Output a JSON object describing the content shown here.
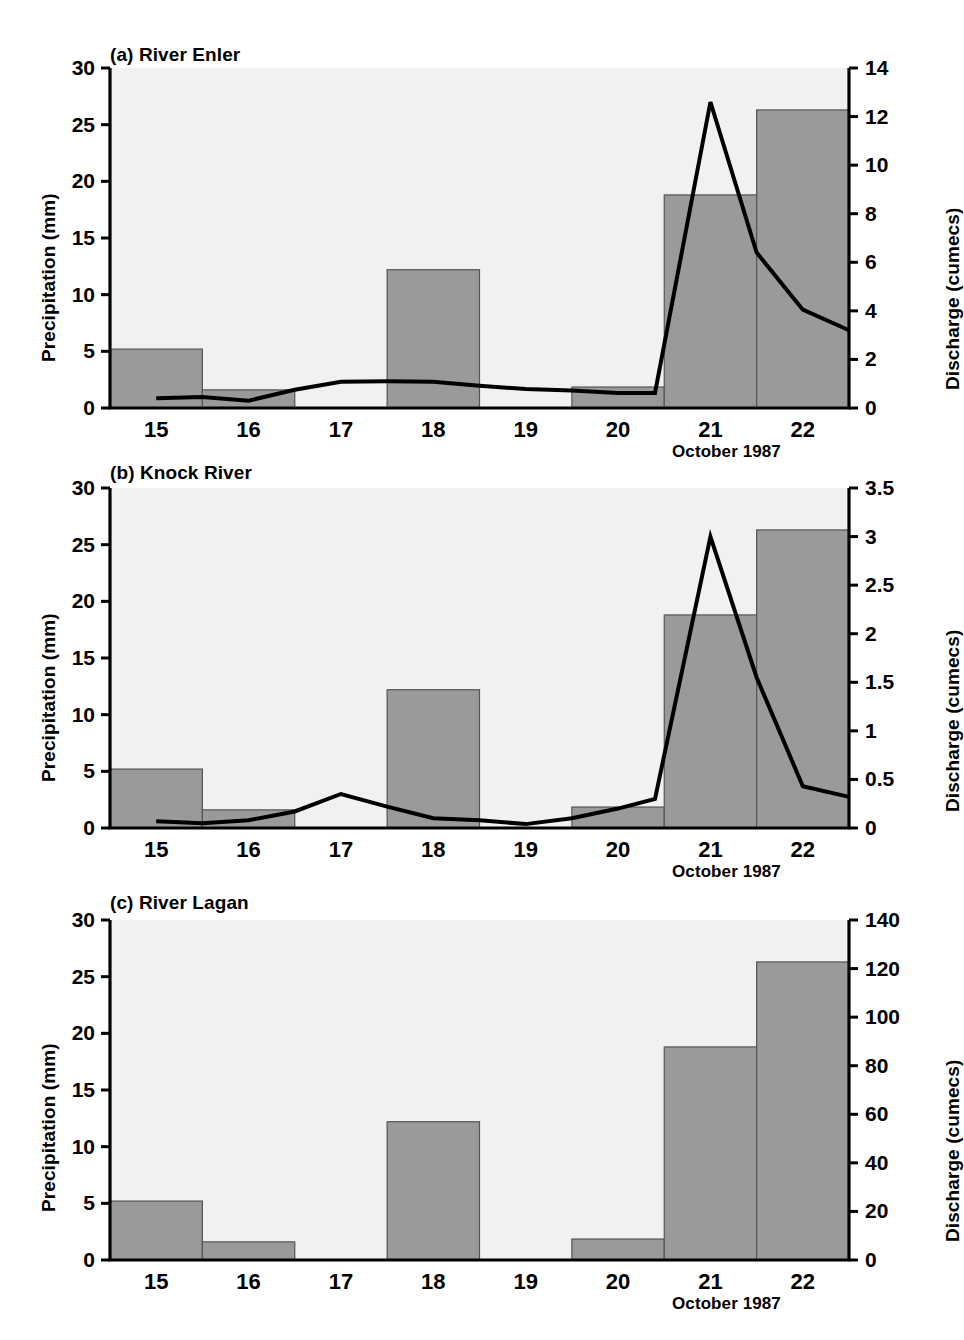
{
  "figure": {
    "background": "#ffffff",
    "bar_fill": "#9a9a9a",
    "bar_stroke": "#555555",
    "plot_bg": "#f1f1f1",
    "axis_color": "#000000",
    "line_color": "#000000"
  },
  "common": {
    "ylabel_left": "Precipitation (mm)",
    "ylabel_right": "Discharge (cumecs)",
    "xaxis_note": "October 1987",
    "x_categories": [
      "15",
      "16",
      "17",
      "18",
      "19",
      "20",
      "21",
      "22"
    ],
    "precip_ticks": [
      "0",
      "5",
      "10",
      "15",
      "20",
      "25",
      "30"
    ],
    "precipitation": [
      5.2,
      1.6,
      0.0,
      12.2,
      0.0,
      1.85,
      18.8,
      26.3
    ]
  },
  "chart_data": [
    {
      "id": "a",
      "type": "bar",
      "title": "(a) River Enler",
      "xlabel": "October 1987",
      "ylabel": "Precipitation (mm)",
      "ylabel2": "Discharge (cumecs)",
      "categories": [
        "15",
        "16",
        "17",
        "18",
        "19",
        "20",
        "21",
        "22"
      ],
      "ylim": [
        0,
        30
      ],
      "yticks": [
        0,
        5,
        10,
        15,
        20,
        25,
        30
      ],
      "ytick_labels": [
        "0",
        "5",
        "10",
        "15",
        "20",
        "25",
        "30"
      ],
      "ylim2": [
        0,
        14
      ],
      "yticks2": [
        0,
        2,
        4,
        6,
        8,
        10,
        12,
        14
      ],
      "ytick_labels2": [
        "0",
        "2",
        "4",
        "6",
        "8",
        "10",
        "12",
        "14"
      ],
      "grid": false,
      "legend": "none",
      "series": [
        {
          "name": "Precipitation",
          "type": "bar",
          "axis": "left",
          "values": [
            5.2,
            1.6,
            0.0,
            12.2,
            0.0,
            1.85,
            18.8,
            26.3
          ]
        },
        {
          "name": "Discharge",
          "type": "line",
          "axis": "right",
          "x": [
            15.0,
            15.5,
            16.0,
            16.5,
            17.0,
            17.5,
            18.0,
            18.5,
            19.0,
            19.5,
            20.0,
            20.4,
            21.0,
            21.5,
            22.0,
            22.5
          ],
          "values": [
            0.4,
            0.45,
            0.3,
            0.75,
            1.08,
            1.1,
            1.08,
            0.92,
            0.78,
            0.72,
            0.62,
            0.62,
            12.6,
            6.4,
            4.05,
            3.2
          ]
        }
      ]
    },
    {
      "id": "b",
      "type": "bar",
      "title": "(b) Knock River",
      "xlabel": "October 1987",
      "ylabel": "Precipitation (mm)",
      "ylabel2": "Discharge (cumecs)",
      "categories": [
        "15",
        "16",
        "17",
        "18",
        "19",
        "20",
        "21",
        "22"
      ],
      "ylim": [
        0,
        30
      ],
      "yticks": [
        0,
        5,
        10,
        15,
        20,
        25,
        30
      ],
      "ytick_labels": [
        "0",
        "5",
        "10",
        "15",
        "20",
        "25",
        "30"
      ],
      "ylim2": [
        0,
        3.5
      ],
      "yticks2": [
        0,
        0.5,
        1,
        1.5,
        2,
        2.5,
        3,
        3.5
      ],
      "ytick_labels2": [
        "0",
        "0.5",
        "1",
        "1.5",
        "2",
        "2.5",
        "3",
        "3.5"
      ],
      "grid": false,
      "legend": "none",
      "series": [
        {
          "name": "Precipitation",
          "type": "bar",
          "axis": "left",
          "values": [
            5.2,
            1.6,
            0.0,
            12.2,
            0.0,
            1.85,
            18.8,
            26.3
          ]
        },
        {
          "name": "Discharge",
          "type": "line",
          "axis": "right",
          "x": [
            15.0,
            15.5,
            16.0,
            16.5,
            17.0,
            17.5,
            18.0,
            18.5,
            19.0,
            19.5,
            20.0,
            20.4,
            21.0,
            21.5,
            22.0,
            22.5
          ],
          "values": [
            0.07,
            0.05,
            0.08,
            0.17,
            0.35,
            0.22,
            0.1,
            0.08,
            0.04,
            0.1,
            0.2,
            0.3,
            3.0,
            1.55,
            0.43,
            0.32
          ]
        }
      ]
    },
    {
      "id": "c",
      "type": "bar",
      "title": "(c) River Lagan",
      "xlabel": "October 1987",
      "ylabel": "Precipitation (mm)",
      "ylabel2": "Discharge (cumecs)",
      "categories": [
        "15",
        "16",
        "17",
        "18",
        "19",
        "20",
        "21",
        "22"
      ],
      "ylim": [
        0,
        30
      ],
      "yticks": [
        0,
        5,
        10,
        15,
        20,
        25,
        30
      ],
      "ytick_labels": [
        "0",
        "5",
        "10",
        "15",
        "20",
        "25",
        "30"
      ],
      "ylim2": [
        0,
        140
      ],
      "yticks2": [
        0,
        20,
        40,
        60,
        80,
        100,
        120,
        140
      ],
      "ytick_labels2": [
        "0",
        "20",
        "40",
        "60",
        "80",
        "100",
        "120",
        "140"
      ],
      "grid": false,
      "legend": "none",
      "series": [
        {
          "name": "Precipitation",
          "type": "bar",
          "axis": "left",
          "values": [
            5.2,
            1.6,
            0.0,
            12.2,
            0.0,
            1.85,
            18.8,
            26.3
          ]
        }
      ]
    }
  ]
}
